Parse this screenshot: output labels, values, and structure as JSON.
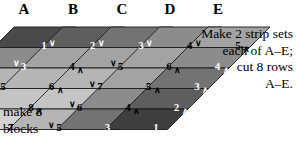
{
  "diagram": {
    "column_headers": [
      "A",
      "B",
      "C",
      "D",
      "E"
    ],
    "annotations": {
      "right": [
        "Make 2 strip sets",
        "each of A–E;",
        "cut 8 rows",
        "A–E."
      ],
      "left": [
        "make 8",
        "blocks"
      ]
    },
    "chevron_down": "∨",
    "chevron_up": "∧",
    "colors": {
      "background": "#ffffff",
      "outline": "#1a1a1a",
      "text_dark": "#000000",
      "text_light": "#ffffff",
      "shade_1": "#4a4a4a",
      "shade_2": "#5e5e5e",
      "shade_3": "#737373",
      "shade_4": "#8c8c8c",
      "shade_5": "#a3a3a3",
      "shade_6": "#b5b5b5",
      "shade_7": "#c4c4c4",
      "shade_8": "#d2d2d2",
      "shade_9": "#dedede",
      "shade_10": "#e8e8e8"
    },
    "strips": [
      {
        "label": "A",
        "cells": [
          {
            "value": "1",
            "fill": "#4a4a4a",
            "text": "#ffffff",
            "mark": "down",
            "mark_side": "right"
          },
          {
            "value": "3",
            "fill": "#8c8c8c",
            "text": "#ffffff",
            "mark": "down",
            "mark_side": "left"
          },
          {
            "value": "5",
            "fill": "#b5b5b5",
            "text": "#000000",
            "mark": "down",
            "mark_side": "left"
          },
          {
            "value": "7",
            "fill": "#c4c4c4",
            "text": "#000000",
            "mark": "down",
            "mark_side": "left"
          },
          {
            "value": "9",
            "fill": "#e8e8e8",
            "text": "#000000",
            "mark": "down",
            "mark_side": "left"
          }
        ]
      },
      {
        "label": "B",
        "cells": [
          {
            "value": "2",
            "fill": "#5e5e5e",
            "text": "#ffffff",
            "mark": "down",
            "mark_side": "right"
          },
          {
            "value": "4",
            "fill": "#a3a3a3",
            "text": "#000000",
            "mark": "up",
            "mark_side": "right"
          },
          {
            "value": "6",
            "fill": "#b5b5b5",
            "text": "#000000",
            "mark": "up",
            "mark_side": "right"
          },
          {
            "value": "8",
            "fill": "#c4c4c4",
            "text": "#000000",
            "mark": "up",
            "mark_side": "right"
          },
          {
            "value": "7",
            "fill": "#d2d2d2",
            "text": "#000000",
            "mark": "none",
            "mark_side": "left"
          }
        ]
      },
      {
        "label": "C",
        "cells": [
          {
            "value": "3",
            "fill": "#737373",
            "text": "#ffffff",
            "mark": "down",
            "mark_side": "right"
          },
          {
            "value": "5",
            "fill": "#a3a3a3",
            "text": "#000000",
            "mark": "down",
            "mark_side": "left"
          },
          {
            "value": "7",
            "fill": "#b5b5b5",
            "text": "#000000",
            "mark": "down",
            "mark_side": "left"
          },
          {
            "value": "6",
            "fill": "#c4c4c4",
            "text": "#000000",
            "mark": "down",
            "mark_side": "left"
          },
          {
            "value": "5",
            "fill": "#b5b5b5",
            "text": "#000000",
            "mark": "down",
            "mark_side": "left"
          }
        ]
      },
      {
        "label": "D",
        "cells": [
          {
            "value": "4",
            "fill": "#8c8c8c",
            "text": "#000000",
            "mark": "down",
            "mark_side": "right"
          },
          {
            "value": "6",
            "fill": "#a3a3a3",
            "text": "#000000",
            "mark": "up",
            "mark_side": "right"
          },
          {
            "value": "5",
            "fill": "#a3a3a3",
            "text": "#000000",
            "mark": "up",
            "mark_side": "right"
          },
          {
            "value": "4",
            "fill": "#8c8c8c",
            "text": "#000000",
            "mark": "up",
            "mark_side": "right"
          },
          {
            "value": "3",
            "fill": "#737373",
            "text": "#ffffff",
            "mark": "none",
            "mark_side": "left"
          }
        ]
      },
      {
        "label": "E",
        "cells": [
          {
            "value": "5",
            "fill": "#a3a3a3",
            "text": "#000000",
            "mark": "up",
            "mark_side": "right"
          },
          {
            "value": "4",
            "fill": "#8c8c8c",
            "text": "#ffffff",
            "mark": "up",
            "mark_side": "right"
          },
          {
            "value": "3",
            "fill": "#737373",
            "text": "#ffffff",
            "mark": "up",
            "mark_side": "right"
          },
          {
            "value": "2",
            "fill": "#5e5e5e",
            "text": "#ffffff",
            "mark": "up",
            "mark_side": "right"
          },
          {
            "value": "1",
            "fill": "#3f3f3f",
            "text": "#ffffff",
            "mark": "none",
            "mark_side": "left"
          }
        ]
      }
    ],
    "geometry": {
      "cell_w": 62,
      "cell_h": 20.5,
      "strip_pitch_x": 48.5,
      "slant_dx": -20.5,
      "origin_x": 14,
      "origin_y": 27,
      "header_x": [
        14,
        63,
        112,
        160,
        208
      ]
    }
  }
}
